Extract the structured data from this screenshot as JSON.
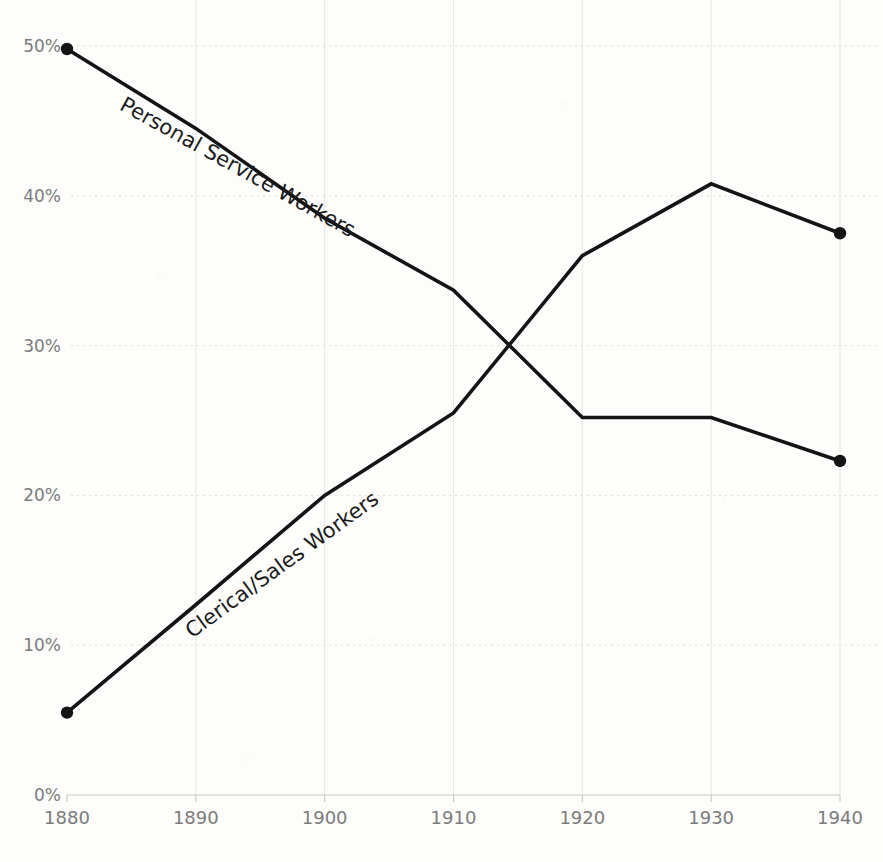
{
  "chart_data": {
    "type": "line",
    "title": "",
    "xlabel": "",
    "ylabel": "",
    "x": [
      1880,
      1890,
      1900,
      1910,
      1920,
      1930,
      1940
    ],
    "xtick_labels": [
      "1880",
      "1890",
      "1900",
      "1910",
      "1920",
      "1930",
      "1940"
    ],
    "ytick_labels": [
      "0%",
      "10%",
      "20%",
      "30%",
      "40%",
      "50%"
    ],
    "ytick_values": [
      0,
      10,
      20,
      30,
      40,
      50
    ],
    "xlim": [
      1880,
      1940
    ],
    "ylim": [
      0,
      50
    ],
    "grid": true,
    "legend_position": "inline-rotated-labels",
    "series": [
      {
        "name": "Personal Service Workers",
        "values": [
          49.8,
          44.5,
          38.5,
          33.7,
          25.2,
          25.2,
          22.3
        ],
        "color": "#141414",
        "label_x": 1893,
        "label_y": 41.5,
        "label_rotation": 29
      },
      {
        "name": "Clerical/Sales Workers",
        "values": [
          5.5,
          12.7,
          20.0,
          25.5,
          36.0,
          40.8,
          37.5
        ],
        "color": "#141414",
        "label_x": 1897,
        "label_y": 15.0,
        "label_rotation": -36
      }
    ]
  },
  "axes": {
    "y_axis_name": "percent-axis",
    "x_axis_name": "year-axis"
  },
  "colors": {
    "background": "#fdfdfc",
    "line": "#141414",
    "gridline": "#d8d8d4",
    "tick_text": "#7b7b7b",
    "label_text": "#1b1b1b"
  }
}
